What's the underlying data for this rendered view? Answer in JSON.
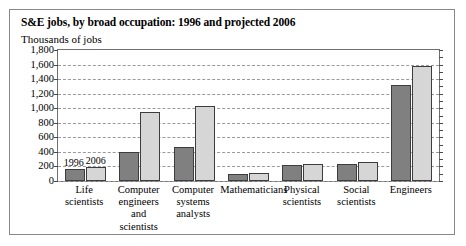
{
  "figure": {
    "title": "S&E jobs, by broad occupation: 1996 and projected 2006",
    "unit_label": "Thousands of jobs"
  },
  "chart_data": {
    "type": "bar",
    "title": "S&E jobs, by broad occupation: 1996 and projected 2006",
    "xlabel": "",
    "ylabel": "Thousands of jobs",
    "ylim": [
      0,
      1800
    ],
    "ytick_step": 200,
    "ytick_labels": [
      "0",
      "200",
      "400",
      "600",
      "800",
      "1,000",
      "1,200",
      "1,400",
      "1,600",
      "1,800"
    ],
    "grid": true,
    "legend_position": "in-plot-above-first-group",
    "categories": [
      "Life scientists",
      "Computer engineers and scientists",
      "Computer systems analysts",
      "Mathematicians",
      "Physical scientists",
      "Social scientists",
      "Engineers"
    ],
    "category_lines": [
      [
        "Life",
        "scientists"
      ],
      [
        "Computer",
        "engineers",
        "and scientists"
      ],
      [
        "Computer",
        "systems",
        "analysts"
      ],
      [
        "Mathematicians"
      ],
      [
        "Physical",
        "scientists"
      ],
      [
        "Social",
        "scientists"
      ],
      [
        "Engineers"
      ]
    ],
    "series": [
      {
        "name": "1996",
        "color": "#808080",
        "values": [
          170,
          400,
          470,
          100,
          215,
          230,
          1320
        ]
      },
      {
        "name": "2006",
        "color": "#d6d6d6",
        "values": [
          190,
          950,
          1030,
          115,
          240,
          265,
          1580
        ]
      }
    ]
  }
}
